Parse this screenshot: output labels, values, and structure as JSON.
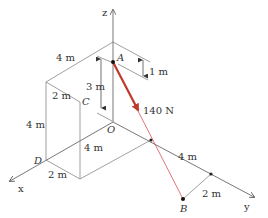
{
  "figure": {
    "type": "3D statics diagram",
    "axes": {
      "x": "x",
      "y": "y",
      "z": "z"
    },
    "points": {
      "A": "A",
      "B": "B",
      "C": "C",
      "D": "D",
      "O": "O"
    },
    "force": {
      "label": "140 N",
      "from": "A",
      "to": "B",
      "color": "#c0392b"
    },
    "dimensions": {
      "top_edge": "4 m",
      "top_depth": "2 m",
      "left_height": "4 m",
      "a_height": "3 m",
      "a_offset": "1 m",
      "bottom_depth": "2 m",
      "base_length": "4 m",
      "y_length": "4 m",
      "b_offset": "2 m"
    },
    "colors": {
      "line": "#555555",
      "force": "#c0392b",
      "text": "#333333"
    }
  }
}
